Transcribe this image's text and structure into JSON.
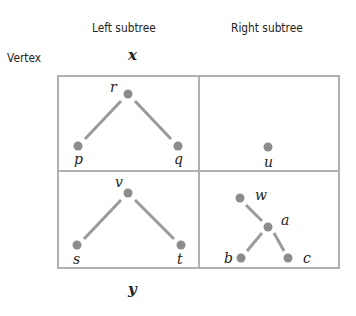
{
  "headers": {
    "left": "Left subtree",
    "right": "Right subtree",
    "row": "Vertex"
  },
  "row_vars": {
    "top": "x",
    "bottom": "y"
  },
  "colors": {
    "node": "#8c8c8c",
    "edge": "#9a9a9a",
    "grid": "#b0b0b0",
    "text": "#222222"
  },
  "cells": {
    "x_left": {
      "nodes": [
        "r",
        "p",
        "q"
      ],
      "edges": [
        [
          "r",
          "p"
        ],
        [
          "r",
          "q"
        ]
      ]
    },
    "x_right": {
      "nodes": [
        "u"
      ],
      "edges": []
    },
    "y_left": {
      "nodes": [
        "v",
        "s",
        "t"
      ],
      "edges": [
        [
          "v",
          "s"
        ],
        [
          "v",
          "t"
        ]
      ]
    },
    "y_right": {
      "nodes": [
        "w",
        "a",
        "b",
        "c"
      ],
      "edges": [
        [
          "w",
          "a"
        ],
        [
          "a",
          "b"
        ],
        [
          "a",
          "c"
        ]
      ]
    }
  },
  "labels": {
    "r": "r",
    "p": "p",
    "q": "q",
    "u": "u",
    "v": "v",
    "s": "s",
    "t": "t",
    "w": "w",
    "a": "a",
    "b": "b",
    "c": "c"
  }
}
